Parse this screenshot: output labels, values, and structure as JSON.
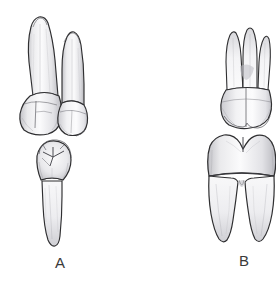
{
  "figure": {
    "kind": "dental-anatomy-illustration",
    "background_color": "#ffffff",
    "width": 276,
    "height": 281
  },
  "panels": [
    {
      "id": "A",
      "label": "A",
      "label_position": {
        "x": 55,
        "y": 255
      },
      "caption_note": "premolar pair",
      "teeth": [
        {
          "name": "maxillary-first-premolar-buccal",
          "arch": "maxillary",
          "view": "buccal",
          "root_count": 2,
          "cusp_count": 2,
          "position": "upper-left-large"
        },
        {
          "name": "maxillary-second-premolar-buccal",
          "arch": "maxillary",
          "view": "buccal",
          "root_count": 1,
          "cusp_count": 2,
          "position": "upper-right-small"
        },
        {
          "name": "mandibular-premolar-occlusal-and-root",
          "arch": "mandibular",
          "view": "occlusal-with-root",
          "root_count": 1,
          "cusp_count": 2,
          "position": "lower-center",
          "occlusal_features": "central fossa with radiating developmental grooves"
        }
      ]
    },
    {
      "id": "B",
      "label": "B",
      "label_position": {
        "x": 239,
        "y": 253
      },
      "caption_note": "molar pair",
      "teeth": [
        {
          "name": "maxillary-first-molar-buccal",
          "arch": "maxillary",
          "view": "buccal",
          "root_count": 3,
          "cusp_count": 2,
          "position": "upper"
        },
        {
          "name": "mandibular-first-molar-buccal",
          "arch": "mandibular",
          "view": "buccal",
          "root_count": 2,
          "cusp_count": 2,
          "position": "lower"
        }
      ]
    }
  ],
  "palette": {
    "outline": "#2f2f31",
    "outline_soft": "#6b6b70",
    "enamel_light": "#fbfbfc",
    "enamel_mid": "#ececed",
    "enamel_shadow": "#d3d3d6",
    "dentin_shade": "#bcbcc1",
    "deep_shadow": "#9a9aa0",
    "groove": "#5c5c62",
    "label_color": "#3a3a3a",
    "background": "#ffffff"
  }
}
